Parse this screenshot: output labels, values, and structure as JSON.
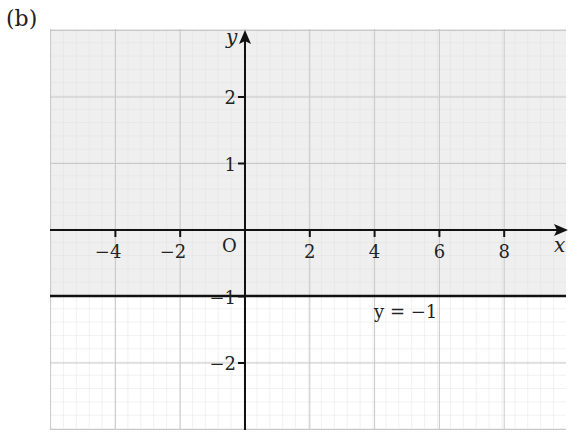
{
  "figure_label": "(b)",
  "chart_data": {
    "type": "line",
    "title": "",
    "xlabel": "x",
    "ylabel": "y",
    "origin_label": "O",
    "xlim": [
      -6,
      10
    ],
    "ylim": [
      -3,
      3
    ],
    "x_ticks": [
      -4,
      -2,
      2,
      4,
      6,
      8
    ],
    "x_tick_labels": [
      "−4",
      "−2",
      "2",
      "4",
      "6",
      "8"
    ],
    "y_ticks": [
      2,
      1,
      -1,
      -2
    ],
    "y_tick_labels": [
      "2",
      "1",
      "−1",
      "−2"
    ],
    "grid": true,
    "series": [
      {
        "name": "y = −1",
        "equation": "y = -1",
        "x": [
          -6,
          10
        ],
        "y": [
          -1,
          -1
        ]
      }
    ],
    "shaded_region": {
      "description": "region y > -1 shaded",
      "condition": "y > -1",
      "color": "#f0f0f0"
    },
    "annotations": [
      {
        "text": "y = −1",
        "x": 4.5,
        "y": -1.5
      }
    ]
  },
  "colors": {
    "axis": "#111111",
    "grid_minor": "#dcdcdc",
    "grid_major": "#c8c8c8",
    "shade": "#efefef"
  }
}
